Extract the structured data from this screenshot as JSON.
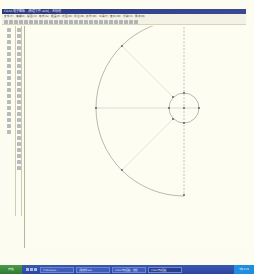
{
  "window": {
    "title": "CAXA 电子图板 - [新建文件.exb] - 无标题"
  },
  "menubar": {
    "items": [
      "文件(F)",
      "编辑(E)",
      "视图(V)",
      "格式(S)",
      "幅面(P)",
      "绘图(D)",
      "标注(N)",
      "修改(M)",
      "工具(T)",
      "窗口(W)",
      "帮助(H)",
      "服务(Q)"
    ]
  },
  "toolbar": {
    "button_count": 27
  },
  "left_toolbar": {
    "button_count": 18
  },
  "left_toolbar2": {
    "button_count": 24
  },
  "drawing": {
    "background": "#fefdf2",
    "line_color": "#888888",
    "arc": {
      "center": [
        183,
        108
      ],
      "radius": 88,
      "start_angle_deg": 90,
      "end_angle_deg": 270
    },
    "small_circle": {
      "center": [
        183,
        108
      ],
      "radius": 15
    },
    "center_line": "dashed vertical",
    "radial_lines_deg": [
      135,
      180,
      225
    ]
  },
  "statusline": {
    "message": "请拾取需删除的元素"
  },
  "taskbar": {
    "start_label": "开始",
    "tasks": [
      {
        "label": "2 Windows...",
        "active": false
      },
      {
        "label": "新建文件.exb",
        "active": false
      },
      {
        "label": "CAXA 电子图板 - 文档",
        "active": false
      },
      {
        "label": "CAXA 电子图板",
        "active": true
      }
    ],
    "tray": "下午 3:45"
  }
}
